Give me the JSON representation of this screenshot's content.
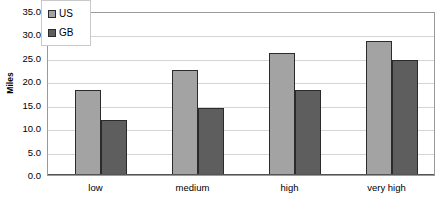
{
  "chart_data": {
    "type": "bar",
    "title": "",
    "xlabel": "",
    "ylabel": "Miles",
    "categories": [
      "low",
      "medium",
      "high",
      "very high"
    ],
    "series": [
      {
        "name": "US",
        "color": "#a3a3a3",
        "values": [
          18.2,
          22.5,
          26.0,
          28.6
        ]
      },
      {
        "name": "GB",
        "color": "#5e5e5e",
        "values": [
          11.7,
          14.3,
          18.1,
          24.5
        ]
      }
    ],
    "ylim": [
      0.0,
      35.0
    ],
    "ytick_step": 5.0,
    "ytick_labels": [
      "35.0",
      "30.0",
      "25.0",
      "20.0",
      "15.0",
      "10.0",
      "5.0",
      "0.0"
    ],
    "ytick_values": [
      35.0,
      30.0,
      25.0,
      20.0,
      15.0,
      10.0,
      5.0,
      0.0
    ],
    "grid": true,
    "grid_axis": "y",
    "legend_position": "top-left-inside",
    "legend_entries": [
      "US",
      "GB"
    ],
    "plot_background": "#ffffff",
    "grid_color": "#d5d5d5",
    "border_color": "#9a9a9a"
  }
}
